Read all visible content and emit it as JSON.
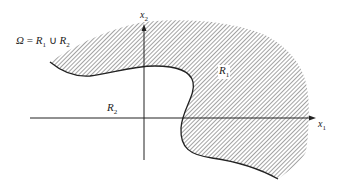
{
  "diagram": {
    "equation_label": {
      "lhs": "Ω",
      "eq": " = ",
      "r1": "R",
      "r1_sub": "1",
      "union": " ∪ ",
      "r2": "R",
      "r2_sub": "2"
    },
    "region_r1_label": {
      "text": "R",
      "sub": "1"
    },
    "region_r2_label": {
      "text": "R",
      "sub": "2"
    },
    "axis_x1_label": {
      "text": "x",
      "sub": "1"
    },
    "axis_x2_label": {
      "text": "x",
      "sub": "2"
    },
    "colors": {
      "hatch": "#555555",
      "boundary": "#222222",
      "axis": "#222222",
      "background": "#ffffff"
    }
  }
}
